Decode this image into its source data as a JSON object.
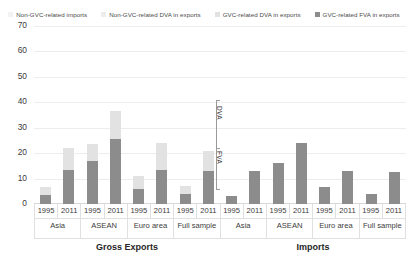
{
  "chart_data": {
    "type": "bar",
    "title": "",
    "subtitle": "",
    "xlabel": "",
    "ylabel": "",
    "ylim": [
      0,
      70
    ],
    "yticks": [
      0,
      10,
      20,
      30,
      40,
      50,
      60,
      70
    ],
    "grid": true,
    "legend_position": "top",
    "stacked": true,
    "categories": [
      "Asia",
      "ASEAN",
      "Euro area",
      "Full sample"
    ],
    "years": [
      "1995",
      "2011"
    ],
    "panels": [
      {
        "name": "Gross Exports",
        "x": [
          "Asia 1995",
          "Asia 2011",
          "ASEAN 1995",
          "ASEAN 2011",
          "Euro area 1995",
          "Euro area 2011",
          "Full sample 1995",
          "Full sample 2011"
        ],
        "series": [
          {
            "name": "GVC-related DVA in exports",
            "color": "#8c8c8c",
            "values": [
              3.5,
              13.5,
              17.0,
              25.5,
              6.0,
              13.5,
              4.0,
              13.0
            ]
          },
          {
            "name": "Non-GVC-related DVA in exports",
            "color": "#e2e2e2",
            "values": [
              3.0,
              8.5,
              6.5,
              11.0,
              5.0,
              10.5,
              3.0,
              8.0
            ]
          }
        ]
      },
      {
        "name": "Imports",
        "x": [
          "Asia 1995",
          "Asia 2011",
          "ASEAN 1995",
          "ASEAN 2011",
          "Euro area 1995",
          "Euro area 2011",
          "Full sample 1995",
          "Full sample 2011"
        ],
        "series": [
          {
            "name": "Non-GVC-related imports",
            "color": "#8c8c8c",
            "values": [
              3.0,
              13.0,
              16.0,
              24.0,
              6.5,
              13.0,
              4.0,
              12.5
            ]
          }
        ]
      }
    ],
    "annotations": [
      {
        "label": "DVA",
        "position": "right-of-gross-exports-upper"
      },
      {
        "label": "FVA",
        "position": "right-of-gross-exports-lower"
      }
    ]
  },
  "legend": {
    "items": [
      {
        "label": "Non-GVC-related imports",
        "color": "#f2f2f2"
      },
      {
        "label": "Non-GVC-related DVA in exports",
        "color": "#ededed"
      },
      {
        "label": "GVC-related DVA in exports",
        "color": "#e2e2e2"
      },
      {
        "label": "GVC-related FVA in exports",
        "color": "#8c8c8c"
      }
    ]
  },
  "y_axis": {
    "ticks": [
      "70",
      "60",
      "50",
      "40",
      "30",
      "20",
      "10",
      "0"
    ]
  },
  "x_axis": {
    "year_labels": [
      "1995",
      "2011",
      "1995",
      "2011",
      "1995",
      "2011",
      "1995",
      "2011",
      "1995",
      "2011",
      "1995",
      "2011",
      "1995",
      "2011",
      "1995",
      "2011"
    ],
    "left_categories": [
      "Asia",
      "ASEAN",
      "Euro area",
      "Full sample"
    ],
    "right_categories": [
      "Asia",
      "ASEAN",
      "Euro area",
      "Full sample"
    ],
    "groups": [
      "Gross Exports",
      "Imports"
    ]
  },
  "annotations": {
    "dva": "DVA",
    "fva": "FVA"
  }
}
